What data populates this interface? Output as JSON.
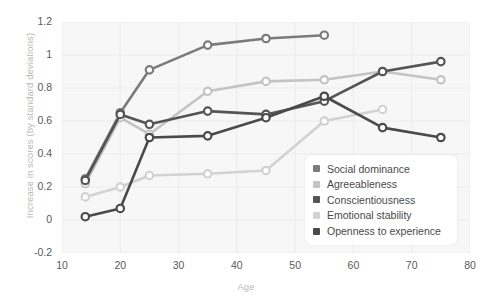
{
  "chart_data": {
    "type": "line",
    "title": "",
    "xlabel": "Age",
    "ylabel": "Increase in scores (by standard deviations)",
    "xlim": [
      10,
      80
    ],
    "ylim": [
      -0.2,
      1.2
    ],
    "xticks": [
      10,
      20,
      30,
      40,
      50,
      60,
      70,
      80
    ],
    "yticks": [
      -0.2,
      0,
      0.2,
      0.4,
      0.6,
      0.8,
      1,
      1.2
    ],
    "xtick_labels": [
      "10",
      "20",
      "30",
      "40",
      "50",
      "60",
      "70",
      "80"
    ],
    "ytick_labels": [
      "-0.2",
      "0",
      "0.2",
      "0.4",
      "0.6",
      "0.8",
      "1",
      "1.2"
    ],
    "grid": true,
    "legend_position": "lower-right",
    "markers": "open-circle",
    "series": [
      {
        "name": "Social dominance",
        "color": "#7b7b7b",
        "x": [
          14,
          20,
          25,
          35,
          45,
          55
        ],
        "y": [
          0.25,
          0.65,
          0.91,
          1.06,
          1.1,
          1.12
        ]
      },
      {
        "name": "Agreeableness",
        "color": "#c4c4c4",
        "x": [
          14,
          20,
          25,
          35,
          45,
          55,
          65,
          75
        ],
        "y": [
          0.22,
          0.62,
          0.52,
          0.78,
          0.84,
          0.85,
          0.9,
          0.85
        ]
      },
      {
        "name": "Conscientiousness",
        "color": "#555555",
        "x": [
          14,
          20,
          25,
          35,
          45,
          55,
          65,
          75
        ],
        "y": [
          0.24,
          0.64,
          0.58,
          0.66,
          0.64,
          0.72,
          0.9,
          0.96
        ]
      },
      {
        "name": "Emotional stability",
        "color": "#d2d2d2",
        "x": [
          14,
          20,
          25,
          35,
          45,
          55,
          65
        ],
        "y": [
          0.14,
          0.2,
          0.27,
          0.28,
          0.3,
          0.6,
          0.67
        ]
      },
      {
        "name": "Openness to experience",
        "color": "#4a4a4a",
        "x": [
          14,
          20,
          25,
          35,
          45,
          55,
          65,
          75
        ],
        "y": [
          0.02,
          0.07,
          0.5,
          0.51,
          0.62,
          0.75,
          0.56,
          0.5
        ]
      }
    ]
  },
  "legend": {
    "items": [
      {
        "label": "Social dominance",
        "color": "#7b7b7b"
      },
      {
        "label": "Agreeableness",
        "color": "#c4c4c4"
      },
      {
        "label": "Conscientiousness",
        "color": "#555555"
      },
      {
        "label": "Emotional stability",
        "color": "#d2d2d2"
      },
      {
        "label": "Openness to experience",
        "color": "#4a4a4a"
      }
    ]
  }
}
